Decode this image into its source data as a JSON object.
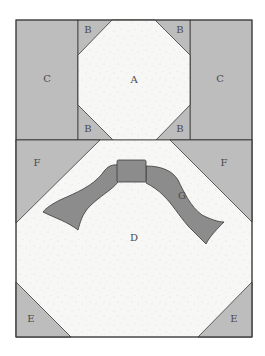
{
  "diagram": {
    "colors": {
      "background_fabric": "#f7f7f5",
      "speckle": "#c8c8c8",
      "light_gray_fabric": "#bdbdbd",
      "bow_fabric": "#8c8c8c",
      "outline": "#3a3a3a"
    },
    "pieces": {
      "A": {
        "label": "A",
        "shape": "octagon",
        "fabric": "background"
      },
      "B": {
        "label": "B",
        "shape": "corner triangles (x4)",
        "fabric": "light gray"
      },
      "C": {
        "label": "C",
        "shape": "side rectangles (x2)",
        "fabric": "light gray"
      },
      "D": {
        "label": "D",
        "shape": "large octagon/hexagon",
        "fabric": "background"
      },
      "E": {
        "label": "E",
        "shape": "bottom corner triangles (x2)",
        "fabric": "light gray"
      },
      "F": {
        "label": "F",
        "shape": "upper corner triangles (x2)",
        "fabric": "light gray"
      },
      "G": {
        "label": "G",
        "shape": "bow",
        "fabric": "dark gray"
      }
    },
    "labels": {
      "a": "A",
      "b_tl": "B",
      "b_tr": "B",
      "b_bl": "B",
      "b_br": "B",
      "c_left": "C",
      "c_right": "C",
      "d": "D",
      "e_left": "E",
      "e_right": "E",
      "f_left": "F",
      "f_right": "F",
      "g": "G"
    }
  }
}
